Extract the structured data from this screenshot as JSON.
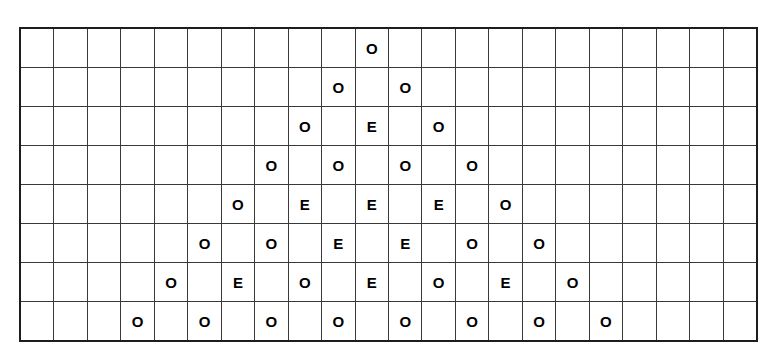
{
  "figure": {
    "kind": "pascal-triangle-parity-grid",
    "rows": 8,
    "columns": 22,
    "symbols": {
      "odd": "O",
      "even": "E",
      "blank": ""
    },
    "colors": {
      "background": "#ffffff",
      "grid_line": "#3a3a3a",
      "outer_border": "#1d1d1d",
      "text": "#000000"
    }
  },
  "chart_data": {
    "type": "table",
    "title": "",
    "xlabel": "",
    "ylabel": "",
    "n_rows": 8,
    "n_cols": 22,
    "legend": [
      "O = odd",
      "E = even"
    ],
    "cells": [
      [
        "",
        "",
        "",
        "",
        "",
        "",
        "",
        "",
        "",
        "",
        "O",
        "",
        "",
        "",
        "",
        "",
        "",
        "",
        "",
        "",
        "",
        ""
      ],
      [
        "",
        "",
        "",
        "",
        "",
        "",
        "",
        "",
        "",
        "O",
        "",
        "O",
        "",
        "",
        "",
        "",
        "",
        "",
        "",
        "",
        "",
        ""
      ],
      [
        "",
        "",
        "",
        "",
        "",
        "",
        "",
        "",
        "O",
        "",
        "E",
        "",
        "O",
        "",
        "",
        "",
        "",
        "",
        "",
        "",
        "",
        ""
      ],
      [
        "",
        "",
        "",
        "",
        "",
        "",
        "",
        "O",
        "",
        "O",
        "",
        "O",
        "",
        "O",
        "",
        "",
        "",
        "",
        "",
        "",
        "",
        ""
      ],
      [
        "",
        "",
        "",
        "",
        "",
        "",
        "O",
        "",
        "E",
        "",
        "E",
        "",
        "E",
        "",
        "O",
        "",
        "",
        "",
        "",
        "",
        "",
        ""
      ],
      [
        "",
        "",
        "",
        "",
        "",
        "O",
        "",
        "O",
        "",
        "E",
        "",
        "E",
        "",
        "O",
        "",
        "O",
        "",
        "",
        "",
        "",
        "",
        ""
      ],
      [
        "",
        "",
        "",
        "",
        "O",
        "",
        "E",
        "",
        "O",
        "",
        "E",
        "",
        "O",
        "",
        "E",
        "",
        "O",
        "",
        "",
        "",
        "",
        ""
      ],
      [
        "",
        "",
        "",
        "O",
        "",
        "O",
        "",
        "O",
        "",
        "O",
        "",
        "O",
        "",
        "O",
        "",
        "O",
        "",
        "O",
        "",
        "",
        "",
        ""
      ]
    ]
  }
}
